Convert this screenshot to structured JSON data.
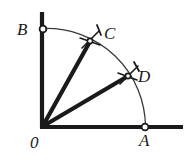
{
  "figure": {
    "background_color": "#ffffff",
    "ink_color": "#1a1a1a",
    "arc_color": "#3a3a3a",
    "width": 190,
    "height": 162,
    "origin": {
      "x": 42,
      "y": 127
    },
    "radius": 99,
    "labels": {
      "B": "B",
      "C": "C",
      "D": "D",
      "O": "0",
      "A": "A"
    },
    "points": [
      {
        "name": "B",
        "label": "B",
        "x": 43,
        "y": 29,
        "marker": "open-circle",
        "on": "vertical-axis",
        "angle_deg": 90
      },
      {
        "name": "C",
        "label": "C",
        "x": 90,
        "y": 41,
        "marker": "arc-cross",
        "on": "arc",
        "angle_deg": 60
      },
      {
        "name": "D",
        "label": "D",
        "x": 128,
        "y": 76,
        "marker": "arc-cross",
        "on": "arc",
        "angle_deg": 30
      },
      {
        "name": "A",
        "label": "A",
        "x": 145,
        "y": 127,
        "marker": "open-circle",
        "on": "horizontal-axis",
        "angle_deg": 0
      },
      {
        "name": "O",
        "label": "0",
        "x": 42,
        "y": 127,
        "marker": "vertex",
        "on": "origin",
        "angle_deg": null
      }
    ],
    "axes": {
      "vertical": {
        "from_x": 42,
        "from_y": 12,
        "to_x": 42,
        "to_y": 127,
        "stroke": 4
      },
      "horizontal": {
        "from_x": 42,
        "from_y": 127,
        "to_x": 183,
        "to_y": 127,
        "stroke": 4
      }
    },
    "arc": {
      "from": "B",
      "to": "A",
      "center": "O",
      "radius": 99,
      "stroke": 1.3
    },
    "rays": [
      {
        "name": "ray-OC",
        "from": "O",
        "to": "C",
        "stroke": 4
      },
      {
        "name": "ray-OD",
        "from": "O",
        "to": "D",
        "stroke": 4
      }
    ]
  }
}
